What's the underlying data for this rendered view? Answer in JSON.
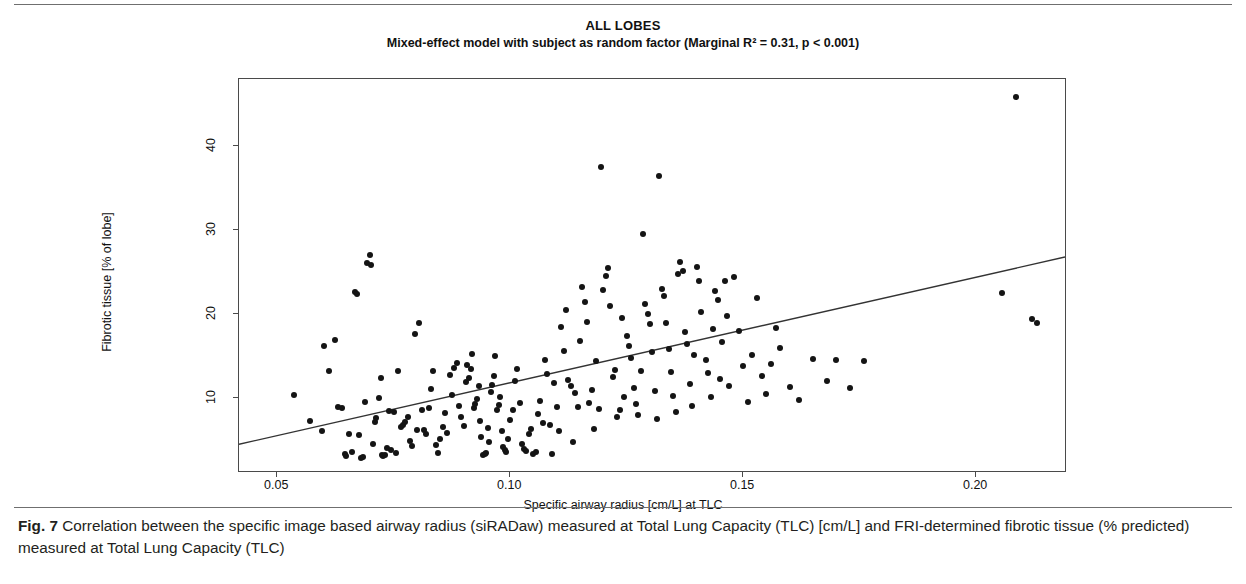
{
  "figure": {
    "caption_label": "Fig. 7",
    "caption_text": " Correlation between the specific image based airway radius (siRADaw) measured at Total Lung Capacity (TLC) [cm/L] and FRI-determined fibrotic tissue (% predicted) measured at Total Lung Capacity (TLC)"
  },
  "chart_data": {
    "type": "scatter",
    "title": "ALL LOBES",
    "subtitle": "Mixed-effect model with subject as random factor (Marginal R² = 0.31, p < 0.001)",
    "xlabel": "Specific airway radius [cm/L] at TLC",
    "ylabel": "Fibrotic tissue [% of lobe]",
    "xlim": [
      0.0418,
      0.2195
    ],
    "ylim": [
      1.1,
      48.0
    ],
    "xticks": [
      0.05,
      0.1,
      0.15,
      0.2
    ],
    "xticklabels": [
      "0.05",
      "0.10",
      "0.15",
      "0.20"
    ],
    "yticks": [
      10,
      20,
      30,
      40
    ],
    "yticklabels": [
      "10",
      "20",
      "30",
      "40"
    ],
    "grid": false,
    "legend": null,
    "marker": {
      "shape": "circle",
      "color": "#141414",
      "size_px": 6
    },
    "fit_line": {
      "label": "mixed-effect model fit",
      "color": "#333333",
      "x_start": 0.0418,
      "y_start": 4.3,
      "x_end": 0.2195,
      "y_end": 26.7,
      "r_squared": 0.31,
      "p_value": "< 0.001"
    },
    "x": [
      0.0535,
      0.057,
      0.0596,
      0.06,
      0.0612,
      0.0625,
      0.063,
      0.064,
      0.0645,
      0.0648,
      0.0655,
      0.066,
      0.0668,
      0.0672,
      0.0675,
      0.068,
      0.0685,
      0.0688,
      0.0692,
      0.07,
      0.0702,
      0.0705,
      0.071,
      0.0713,
      0.0718,
      0.0722,
      0.0725,
      0.0728,
      0.0732,
      0.0736,
      0.074,
      0.0745,
      0.075,
      0.0755,
      0.076,
      0.0765,
      0.077,
      0.0775,
      0.078,
      0.0785,
      0.079,
      0.0795,
      0.08,
      0.0805,
      0.081,
      0.0815,
      0.082,
      0.0825,
      0.083,
      0.0835,
      0.084,
      0.0845,
      0.085,
      0.0855,
      0.086,
      0.0865,
      0.087,
      0.0875,
      0.088,
      0.0885,
      0.089,
      0.0895,
      0.09,
      0.0905,
      0.0908,
      0.0912,
      0.0915,
      0.0918,
      0.0922,
      0.0925,
      0.0928,
      0.0932,
      0.0935,
      0.0938,
      0.0942,
      0.0945,
      0.0948,
      0.0952,
      0.0955,
      0.0958,
      0.0962,
      0.0965,
      0.0968,
      0.0972,
      0.0975,
      0.0978,
      0.0982,
      0.0985,
      0.0988,
      0.0992,
      0.0995,
      0.1,
      0.1005,
      0.101,
      0.1015,
      0.102,
      0.1025,
      0.103,
      0.1035,
      0.104,
      0.1045,
      0.105,
      0.1055,
      0.106,
      0.1065,
      0.107,
      0.1075,
      0.108,
      0.1085,
      0.109,
      0.1095,
      0.11,
      0.1105,
      0.111,
      0.1115,
      0.112,
      0.1125,
      0.113,
      0.1135,
      0.114,
      0.1145,
      0.115,
      0.1155,
      0.116,
      0.1165,
      0.117,
      0.1175,
      0.118,
      0.1185,
      0.119,
      0.1195,
      0.12,
      0.1205,
      0.121,
      0.1215,
      0.122,
      0.1225,
      0.123,
      0.1235,
      0.124,
      0.1245,
      0.125,
      0.1255,
      0.126,
      0.1265,
      0.127,
      0.1275,
      0.128,
      0.1285,
      0.129,
      0.1295,
      0.13,
      0.1305,
      0.131,
      0.1315,
      0.132,
      0.1325,
      0.133,
      0.1335,
      0.134,
      0.1345,
      0.135,
      0.1355,
      0.136,
      0.1365,
      0.137,
      0.1375,
      0.138,
      0.1385,
      0.139,
      0.1395,
      0.14,
      0.1405,
      0.141,
      0.142,
      0.1425,
      0.143,
      0.1435,
      0.144,
      0.1445,
      0.145,
      0.1455,
      0.146,
      0.1465,
      0.147,
      0.148,
      0.149,
      0.15,
      0.151,
      0.152,
      0.153,
      0.154,
      0.155,
      0.156,
      0.157,
      0.158,
      0.16,
      0.162,
      0.165,
      0.168,
      0.17,
      0.173,
      0.176,
      0.2055,
      0.2085,
      0.212,
      0.213
    ],
    "y": [
      10.4,
      7.3,
      6.1,
      16.2,
      13.2,
      16.9,
      9.0,
      8.8,
      3.4,
      3.1,
      5.8,
      3.6,
      22.6,
      22.4,
      5.6,
      2.9,
      3.0,
      9.6,
      26.1,
      27.0,
      25.8,
      4.6,
      7.2,
      7.6,
      10.0,
      12.4,
      3.2,
      3.1,
      3.3,
      4.1,
      8.5,
      3.8,
      8.4,
      3.5,
      13.2,
      6.6,
      6.8,
      7.2,
      7.8,
      4.9,
      4.3,
      17.6,
      6.2,
      18.9,
      8.6,
      6.2,
      5.7,
      8.8,
      11.1,
      13.3,
      4.4,
      3.5,
      5.1,
      6.6,
      8.2,
      5.9,
      12.8,
      10.4,
      13.6,
      14.2,
      9.1,
      7.8,
      6.7,
      11.9,
      14.0,
      12.4,
      13.5,
      15.3,
      8.8,
      9.3,
      9.9,
      11.5,
      7.3,
      5.4,
      3.3,
      3.4,
      3.5,
      6.4,
      4.8,
      10.8,
      11.6,
      12.6,
      15.0,
      8.6,
      9.2,
      10.2,
      6.1,
      4.2,
      3.8,
      3.6,
      5.2,
      7.4,
      8.6,
      12.1,
      13.5,
      9.4,
      4.5,
      4.0,
      3.7,
      5.8,
      6.3,
      3.4,
      3.6,
      8.1,
      9.7,
      7.0,
      14.5,
      12.9,
      6.8,
      3.4,
      11.8,
      9.0,
      6.1,
      18.5,
      15.6,
      20.5,
      12.2,
      11.5,
      4.8,
      10.6,
      8.9,
      16.8,
      23.2,
      21.5,
      19.1,
      9.4,
      11.0,
      6.3,
      14.4,
      8.7,
      37.5,
      22.9,
      24.5,
      25.5,
      21.0,
      12.5,
      13.4,
      7.8,
      8.6,
      19.6,
      10.2,
      17.4,
      16.2,
      14.8,
      11.2,
      9.3,
      8.0,
      13.3,
      29.5,
      21.2,
      20.0,
      18.8,
      15.5,
      10.9,
      7.5,
      36.4,
      23.0,
      22.2,
      19.0,
      15.9,
      13.1,
      10.3,
      8.4,
      24.8,
      26.2,
      25.1,
      17.9,
      16.4,
      11.7,
      9.1,
      15.1,
      25.6,
      24.0,
      20.3,
      14.6,
      13.0,
      10.1,
      18.2,
      22.8,
      21.7,
      12.3,
      16.7,
      23.9,
      19.8,
      11.4,
      24.4,
      18.0,
      13.8,
      9.5,
      15.2,
      21.9,
      12.7,
      10.5,
      14.1,
      18.4,
      16.0,
      11.3,
      9.8,
      14.7,
      12.0,
      14.6,
      11.2,
      14.4,
      22.5,
      45.8,
      19.4,
      18.9
    ]
  }
}
